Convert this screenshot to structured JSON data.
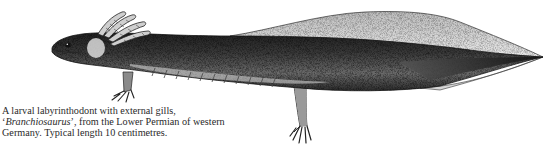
{
  "figure": {
    "ink_color": "#1a1a1a",
    "paper_color": "#ffffff"
  },
  "caption": {
    "line1": "A larval labyrinthodont with external gills,",
    "line2_quote_open": "‘",
    "line2_genus": "Branchiosaurus",
    "line2_rest": "’, from the Lower Permian of western",
    "line3": "Germany. Typical length 10 centimetres."
  }
}
